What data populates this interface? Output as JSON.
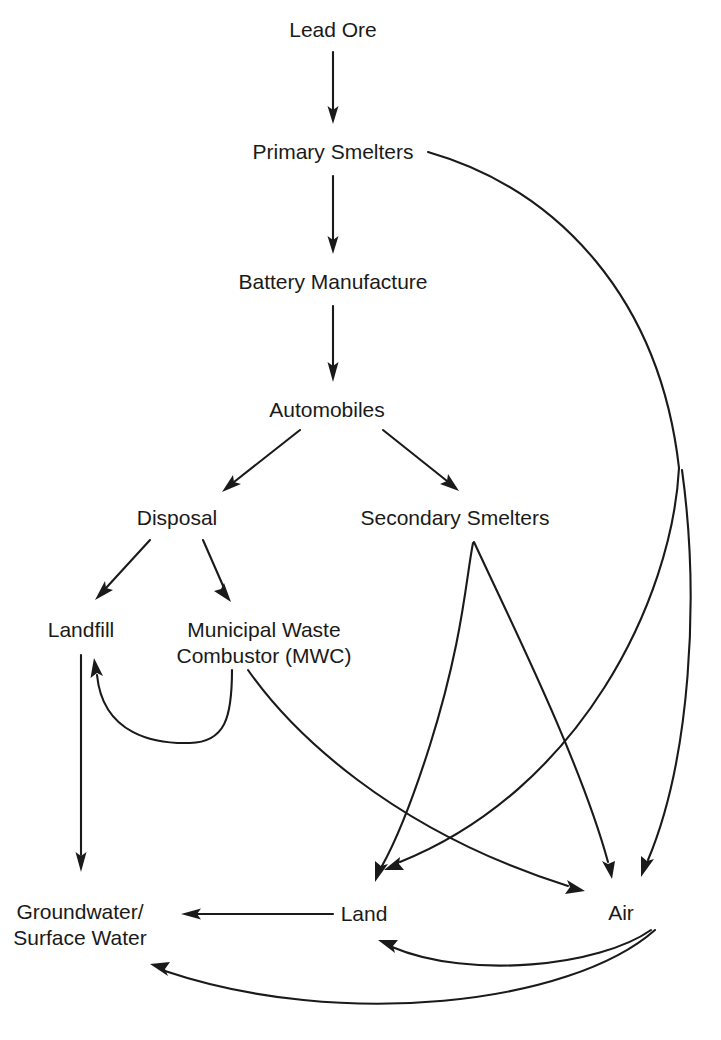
{
  "diagram": {
    "type": "flowchart",
    "background_color": "#ffffff",
    "line_color": "#1a1a1a",
    "text_color": "#1a1a1a",
    "nodes": [
      {
        "id": "lead_ore",
        "label": "Lead Ore",
        "x": 333,
        "y": 30
      },
      {
        "id": "primary",
        "label": "Primary Smelters",
        "x": 333,
        "y": 152
      },
      {
        "id": "battery",
        "label": "Battery Manufacture",
        "x": 333,
        "y": 282
      },
      {
        "id": "automobiles",
        "label": "Automobiles",
        "x": 327,
        "y": 410
      },
      {
        "id": "disposal",
        "label": "Disposal",
        "x": 177,
        "y": 518
      },
      {
        "id": "secondary",
        "label": "Secondary Smelters",
        "x": 455,
        "y": 518
      },
      {
        "id": "landfill",
        "label": "Landfill",
        "x": 81,
        "y": 630
      },
      {
        "id": "mwc",
        "label": "Municipal Waste\nCombustor (MWC)",
        "x": 264,
        "y": 643
      },
      {
        "id": "groundwater",
        "label": "Groundwater/\nSurface Water",
        "x": 80,
        "y": 925
      },
      {
        "id": "land",
        "label": "Land",
        "x": 364,
        "y": 914
      },
      {
        "id": "air",
        "label": "Air",
        "x": 621,
        "y": 913
      }
    ],
    "edges": [
      {
        "id": "e1",
        "from": "lead_ore",
        "to": "primary",
        "style": "straight"
      },
      {
        "id": "e2",
        "from": "primary",
        "to": "battery",
        "style": "straight"
      },
      {
        "id": "e3",
        "from": "battery",
        "to": "automobiles",
        "style": "straight"
      },
      {
        "id": "e4",
        "from": "automobiles",
        "to": "disposal",
        "style": "straight"
      },
      {
        "id": "e5",
        "from": "automobiles",
        "to": "secondary",
        "style": "straight"
      },
      {
        "id": "e6",
        "from": "disposal",
        "to": "landfill",
        "style": "straight"
      },
      {
        "id": "e7",
        "from": "disposal",
        "to": "mwc",
        "style": "straight"
      },
      {
        "id": "e8",
        "from": "landfill",
        "to": "groundwater",
        "style": "straight"
      },
      {
        "id": "e9",
        "from": "mwc",
        "to": "landfill",
        "style": "curve"
      },
      {
        "id": "e10",
        "from": "mwc",
        "to": "air",
        "style": "curve"
      },
      {
        "id": "e11",
        "from": "secondary",
        "to": "land",
        "style": "curve"
      },
      {
        "id": "e12",
        "from": "secondary",
        "to": "air",
        "style": "curve"
      },
      {
        "id": "e13",
        "from": "primary",
        "to": "land",
        "style": "curve"
      },
      {
        "id": "e14",
        "from": "primary",
        "to": "air",
        "style": "curve"
      },
      {
        "id": "e15",
        "from": "land",
        "to": "groundwater",
        "style": "straight"
      },
      {
        "id": "e16",
        "from": "air",
        "to": "land",
        "style": "curve"
      },
      {
        "id": "e17",
        "from": "air",
        "to": "groundwater",
        "style": "curve"
      }
    ]
  }
}
